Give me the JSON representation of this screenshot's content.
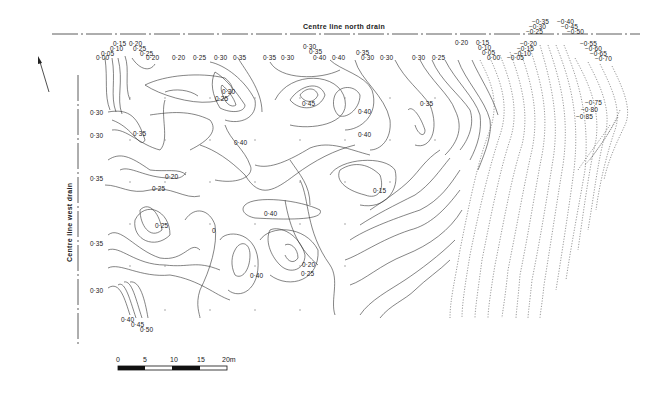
{
  "map": {
    "north_drain_label": "Centre line north drain",
    "west_drain_label": "Centre line west drain",
    "north_arrow": "north-arrow",
    "scale_bar": {
      "ticks": [
        "0",
        "5",
        "10",
        "15",
        "20m"
      ]
    },
    "top_labels": [
      "0·15",
      "0·20",
      "0·10",
      "0·25",
      "0·05",
      "0·25",
      "0·00",
      "0·20",
      "0·20",
      "0·25",
      "0·30",
      "0·35",
      "0·35",
      "0·30",
      "0·30",
      "0·35",
      "0·40",
      "0·40",
      "0·35",
      "0·30",
      "0·30",
      "0·30",
      "0·25",
      "0·20",
      "0·15",
      "0·10",
      "0·05",
      "0·00",
      "−0·05"
    ],
    "top_right_labels": [
      "−0·35",
      "−0·40",
      "−0·30",
      "−0·45",
      "−0·25",
      "−0·50",
      "−0·20",
      "−0·15",
      "−0·10",
      "−0·55",
      "−0·60",
      "−0·65",
      "−0·70"
    ],
    "right_labels": [
      "−0·75",
      "−0·80",
      "−0·85"
    ],
    "left_labels": [
      "0·30",
      "0·30",
      "0·35",
      "0·35",
      "0·30"
    ],
    "bottom_labels": [
      "0·40",
      "0·45",
      "0·50"
    ],
    "interior_labels": [
      "0·30",
      "0·25",
      "0·45",
      "0·40",
      "0·35",
      "0·35",
      "0·20",
      "0·25",
      "0·25",
      "0·40",
      "0·40",
      "0·15",
      "0·40",
      "0",
      "0·20",
      "0·25",
      "0·40"
    ]
  }
}
